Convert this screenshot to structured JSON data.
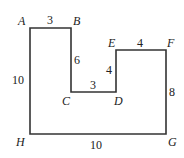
{
  "diagram": {
    "polygon": "30,28 71,28 71,92 116,92 116,50 166,50 166,134 30,134",
    "vertices": {
      "A": {
        "label": "A"
      },
      "B": {
        "label": "B"
      },
      "C": {
        "label": "C"
      },
      "D": {
        "label": "D"
      },
      "E": {
        "label": "E"
      },
      "F": {
        "label": "F"
      },
      "G": {
        "label": "G"
      },
      "H": {
        "label": "H"
      }
    },
    "lengths": {
      "AB": "3",
      "BC": "6",
      "CD": "3",
      "DE": "4",
      "EF": "4",
      "FG": "8",
      "GH": "10",
      "HA": "10"
    }
  }
}
